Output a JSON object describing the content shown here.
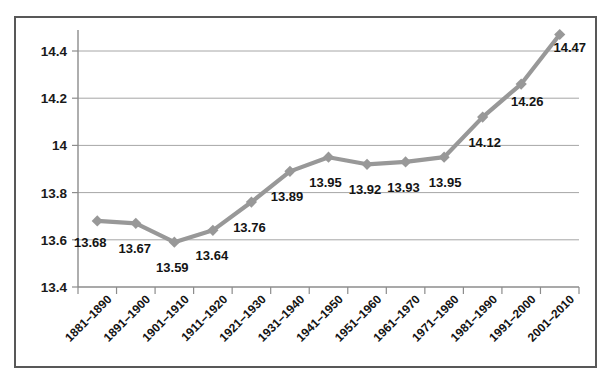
{
  "chart_data": {
    "type": "line",
    "title": "",
    "subtitle": "",
    "xlabel": "",
    "ylabel": "",
    "categories": [
      "1881–1890",
      "1891–1900",
      "1901–1910",
      "1911–1920",
      "1921–1930",
      "1931–1940",
      "1941–1950",
      "1951–1960",
      "1961–1970",
      "1971–1980",
      "1981–1990",
      "1991–2000",
      "2001–2010"
    ],
    "values": [
      13.68,
      13.67,
      13.59,
      13.64,
      13.76,
      13.89,
      13.95,
      13.92,
      13.93,
      13.95,
      14.12,
      14.26,
      14.47
    ],
    "point_labels": [
      "13.68",
      "13.67",
      "13.59",
      "13.64",
      "13.76",
      "13.89",
      "13.95",
      "13.92",
      "13.93",
      "13.95",
      "14.12",
      "14.26",
      "14.47"
    ],
    "ylim": [
      13.4,
      14.4
    ],
    "ytick_values": [
      13.4,
      13.6,
      13.8,
      14.0,
      14.2,
      14.4
    ],
    "ytick_labels": [
      "13.4",
      "13.6",
      "13.8",
      "14",
      "14.2",
      "14.4"
    ],
    "grid": true,
    "legend": "none",
    "series": [
      {
        "name": "series-1",
        "marker": "diamond",
        "color": "#989898",
        "values": [
          13.68,
          13.67,
          13.59,
          13.64,
          13.76,
          13.89,
          13.95,
          13.92,
          13.93,
          13.95,
          14.12,
          14.26,
          14.47
        ]
      }
    ],
    "colors": {
      "line": "#989898",
      "marker": "#989898",
      "gridline": "#a6a6a6",
      "axis": "#8c8c8c",
      "border": "#585858",
      "text": "#141414",
      "background": "#ffffff"
    },
    "xlabel_rotation": -45
  }
}
